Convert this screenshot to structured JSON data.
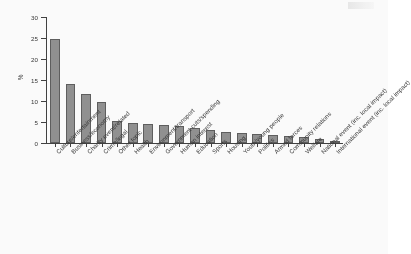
{
  "figure": {
    "background_color": "#ffffff",
    "bar_fill_color": "#8e8e8e",
    "bar_edge_color": "#5a5a5a",
    "axis_color": "#3b3b3b",
    "text_color": "#333333"
  },
  "chart_data": {
    "type": "bar",
    "title": "",
    "subtitle": "",
    "xlabel": "",
    "ylabel": "%",
    "ylim": [
      0,
      30
    ],
    "yticks": [
      0,
      5,
      10,
      15,
      20,
      25,
      30
    ],
    "ytick_labels": [
      "0",
      "5",
      "10",
      "15",
      "20",
      "25",
      "30"
    ],
    "grid": false,
    "legend": null,
    "legend_position": "none",
    "xtick_rotation": -45,
    "categories": [
      "Culture/entertainment",
      "Business/economy",
      "Charity event/related",
      "Crime/legal",
      "Other topic",
      "Health",
      "Environment/transport",
      "Government cuts/spending",
      "Human interest",
      "Education",
      "Sports",
      "Housing",
      "Youth/young people",
      "Politics",
      "Armed forces",
      "Community relations",
      "Welfare",
      "National event (inc. local impact)",
      "International event (inc. local impact)"
    ],
    "values": [
      24.8,
      14.0,
      11.6,
      9.7,
      5.2,
      4.8,
      4.6,
      4.3,
      4.1,
      3.6,
      3.2,
      2.6,
      2.4,
      2.2,
      1.9,
      1.7,
      1.5,
      1.0,
      0.3
    ]
  }
}
